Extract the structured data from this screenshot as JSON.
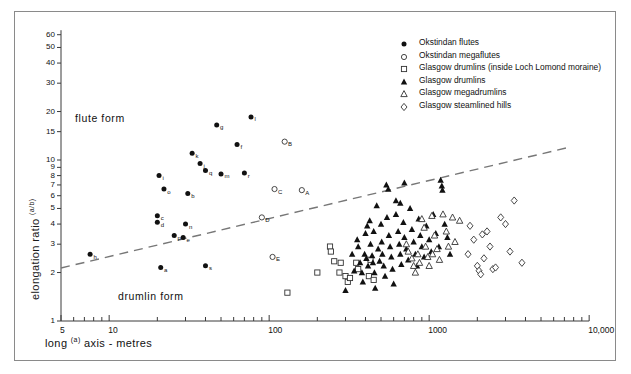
{
  "figure": {
    "region_labels": [
      {
        "text": "flute form",
        "x": 75,
        "y": 112
      },
      {
        "text": "drumlin form",
        "x": 118,
        "y": 290
      }
    ],
    "trend_line": {
      "x1": 61,
      "y1": 268,
      "x2": 566,
      "y2": 148,
      "style": "dashed"
    }
  },
  "legend": {
    "items": [
      {
        "symbol": "filled-circle",
        "label": "Okstindan flutes"
      },
      {
        "symbol": "open-circle",
        "label": "Okstindan megaflutes"
      },
      {
        "symbol": "open-square",
        "label": "Glasgow drumlins (inside Loch Lomond moraine)"
      },
      {
        "symbol": "filled-triangle",
        "label": "Glasgow drumlins"
      },
      {
        "symbol": "open-triangle",
        "label": "Glasgow megadrumlins"
      },
      {
        "symbol": "open-diamond",
        "label": "Glasgow steamlined hills"
      }
    ]
  },
  "chart_data": {
    "type": "scatter",
    "title": "",
    "xlabel": "long (a) axis  -  metres",
    "ylabel": "elongation ratio (a/b)",
    "xscale": "log",
    "yscale": "log",
    "xlim": [
      5,
      10000
    ],
    "ylim": [
      1,
      65
    ],
    "grid": false,
    "legend_position": "top-right",
    "xticks_labeled": [
      {
        "value": 5,
        "label": "5"
      },
      {
        "value": 10,
        "label": "10"
      },
      {
        "value": 100,
        "label": "100"
      },
      {
        "value": 1000,
        "label": "1000"
      },
      {
        "value": 10000,
        "label": "10,000"
      }
    ],
    "xticks_minor": [
      6,
      7,
      8,
      9,
      20,
      30,
      40,
      50,
      60,
      70,
      80,
      90,
      200,
      300,
      400,
      500,
      600,
      700,
      800,
      900,
      2000,
      3000,
      4000,
      5000,
      6000,
      7000,
      8000,
      9000
    ],
    "yticks_labeled": [
      {
        "value": 1,
        "label": "1"
      },
      {
        "value": 2,
        "label": "2"
      },
      {
        "value": 3,
        "label": "3"
      },
      {
        "value": 4,
        "label": "4"
      },
      {
        "value": 5,
        "label": "5"
      },
      {
        "value": 6,
        "label": "6"
      },
      {
        "value": 7,
        "label": "7"
      },
      {
        "value": 8,
        "label": "8"
      },
      {
        "value": 9,
        "label": "9"
      },
      {
        "value": 10,
        "label": "10"
      },
      {
        "value": 15,
        "label": "15"
      },
      {
        "value": 20,
        "label": "20"
      },
      {
        "value": 30,
        "label": "30"
      },
      {
        "value": 40,
        "label": "40"
      },
      {
        "value": 50,
        "label": "50"
      },
      {
        "value": 60,
        "label": "60"
      }
    ],
    "annotation_line": {
      "label": "",
      "from": [
        5,
        2.0
      ],
      "to": [
        10000,
        11.5
      ]
    },
    "series": [
      {
        "name": "Okstindan flutes",
        "symbol": "filled-circle",
        "points": [
          {
            "x": 7.6,
            "y": 2.6,
            "label": "h"
          },
          {
            "x": 20,
            "y": 4.5,
            "label": "c"
          },
          {
            "x": 20,
            "y": 4.1,
            "label": "d"
          },
          {
            "x": 20.5,
            "y": 8.0,
            "label": "i"
          },
          {
            "x": 22,
            "y": 6.6,
            "label": "o"
          },
          {
            "x": 25.5,
            "y": 3.4,
            "label": "p"
          },
          {
            "x": 29,
            "y": 3.3,
            "label": "e"
          },
          {
            "x": 21,
            "y": 2.15,
            "label": "a"
          },
          {
            "x": 31,
            "y": 6.2,
            "label": "b"
          },
          {
            "x": 33,
            "y": 11.0,
            "label": "k"
          },
          {
            "x": 37,
            "y": 9.5,
            "label": "j"
          },
          {
            "x": 40,
            "y": 8.6,
            "label": "q"
          },
          {
            "x": 40,
            "y": 2.2,
            "label": "s"
          },
          {
            "x": 47,
            "y": 16.5,
            "label": "g"
          },
          {
            "x": 50,
            "y": 8.2,
            "label": "m"
          },
          {
            "x": 63,
            "y": 12.5,
            "label": "f"
          },
          {
            "x": 70,
            "y": 8.3,
            "label": "r"
          },
          {
            "x": 77,
            "y": 18.5,
            "label": "l"
          },
          {
            "x": 30,
            "y": 4.0,
            "label": "n"
          }
        ]
      },
      {
        "name": "Okstindan megaflutes",
        "symbol": "open-circle",
        "points": [
          {
            "x": 90,
            "y": 4.4,
            "label": "D"
          },
          {
            "x": 105,
            "y": 2.5,
            "label": "E"
          },
          {
            "x": 108,
            "y": 6.6,
            "label": "C"
          },
          {
            "x": 125,
            "y": 13.0,
            "label": "B"
          },
          {
            "x": 160,
            "y": 6.5,
            "label": "A"
          }
        ]
      },
      {
        "name": "Glasgow drumlins (inside Loch Lomond moraine)",
        "symbol": "open-square",
        "points": [
          {
            "x": 130,
            "y": 1.5
          },
          {
            "x": 200,
            "y": 2.0
          },
          {
            "x": 240,
            "y": 2.9
          },
          {
            "x": 243,
            "y": 2.7
          },
          {
            "x": 255,
            "y": 2.35
          },
          {
            "x": 275,
            "y": 2.0
          },
          {
            "x": 280,
            "y": 2.3
          },
          {
            "x": 300,
            "y": 1.9
          },
          {
            "x": 310,
            "y": 1.75
          },
          {
            "x": 320,
            "y": 1.85
          },
          {
            "x": 350,
            "y": 2.3
          },
          {
            "x": 360,
            "y": 2.1
          },
          {
            "x": 420,
            "y": 1.9
          },
          {
            "x": 430,
            "y": 2.4
          },
          {
            "x": 450,
            "y": 1.8
          }
        ]
      },
      {
        "name": "Glasgow drumlins",
        "symbol": "filled-triangle",
        "points": [
          {
            "x": 300,
            "y": 1.55
          },
          {
            "x": 330,
            "y": 2.6
          },
          {
            "x": 340,
            "y": 2.05
          },
          {
            "x": 355,
            "y": 3.2
          },
          {
            "x": 360,
            "y": 2.9
          },
          {
            "x": 370,
            "y": 2.3
          },
          {
            "x": 380,
            "y": 2.0
          },
          {
            "x": 385,
            "y": 1.75
          },
          {
            "x": 395,
            "y": 2.6
          },
          {
            "x": 400,
            "y": 3.5
          },
          {
            "x": 405,
            "y": 2.45
          },
          {
            "x": 410,
            "y": 3.9
          },
          {
            "x": 415,
            "y": 2.2
          },
          {
            "x": 425,
            "y": 4.2
          },
          {
            "x": 430,
            "y": 3.0
          },
          {
            "x": 440,
            "y": 2.55
          },
          {
            "x": 445,
            "y": 2.3
          },
          {
            "x": 450,
            "y": 3.6
          },
          {
            "x": 455,
            "y": 2.0
          },
          {
            "x": 460,
            "y": 1.6
          },
          {
            "x": 470,
            "y": 5.2
          },
          {
            "x": 480,
            "y": 2.8
          },
          {
            "x": 490,
            "y": 2.35
          },
          {
            "x": 500,
            "y": 4.0
          },
          {
            "x": 505,
            "y": 3.1
          },
          {
            "x": 510,
            "y": 2.6
          },
          {
            "x": 520,
            "y": 2.2
          },
          {
            "x": 530,
            "y": 1.9
          },
          {
            "x": 545,
            "y": 4.4
          },
          {
            "x": 555,
            "y": 6.6
          },
          {
            "x": 560,
            "y": 3.4
          },
          {
            "x": 570,
            "y": 2.9
          },
          {
            "x": 580,
            "y": 2.5
          },
          {
            "x": 590,
            "y": 2.1
          },
          {
            "x": 600,
            "y": 1.7
          },
          {
            "x": 620,
            "y": 4.6
          },
          {
            "x": 640,
            "y": 3.6
          },
          {
            "x": 650,
            "y": 3.0
          },
          {
            "x": 660,
            "y": 2.6
          },
          {
            "x": 670,
            "y": 2.25
          },
          {
            "x": 690,
            "y": 4.1
          },
          {
            "x": 700,
            "y": 3.3
          },
          {
            "x": 720,
            "y": 2.8
          },
          {
            "x": 740,
            "y": 2.4
          },
          {
            "x": 760,
            "y": 5.0
          },
          {
            "x": 780,
            "y": 3.7
          },
          {
            "x": 800,
            "y": 3.1
          },
          {
            "x": 820,
            "y": 2.6
          },
          {
            "x": 840,
            "y": 2.2
          },
          {
            "x": 860,
            "y": 4.3
          },
          {
            "x": 880,
            "y": 3.4
          },
          {
            "x": 900,
            "y": 2.9
          },
          {
            "x": 930,
            "y": 2.5
          },
          {
            "x": 960,
            "y": 3.9
          },
          {
            "x": 1000,
            "y": 3.2
          },
          {
            "x": 1030,
            "y": 2.7
          },
          {
            "x": 1060,
            "y": 4.6
          },
          {
            "x": 1100,
            "y": 3.5
          },
          {
            "x": 1150,
            "y": 2.9
          },
          {
            "x": 1200,
            "y": 6.9
          },
          {
            "x": 1210,
            "y": 6.5
          },
          {
            "x": 1250,
            "y": 4.0
          },
          {
            "x": 1300,
            "y": 3.3
          },
          {
            "x": 1350,
            "y": 2.6
          },
          {
            "x": 540,
            "y": 7.0
          },
          {
            "x": 700,
            "y": 7.2
          },
          {
            "x": 1180,
            "y": 7.5
          },
          {
            "x": 620,
            "y": 5.6
          },
          {
            "x": 660,
            "y": 5.4
          }
        ]
      },
      {
        "name": "Glasgow megadrumlins",
        "symbol": "open-triangle",
        "points": [
          {
            "x": 780,
            "y": 2.45
          },
          {
            "x": 800,
            "y": 2.2
          },
          {
            "x": 820,
            "y": 2.0
          },
          {
            "x": 850,
            "y": 2.6
          },
          {
            "x": 870,
            "y": 2.3
          },
          {
            "x": 900,
            "y": 4.3
          },
          {
            "x": 930,
            "y": 3.8
          },
          {
            "x": 950,
            "y": 2.9
          },
          {
            "x": 980,
            "y": 2.5
          },
          {
            "x": 1000,
            "y": 2.2
          },
          {
            "x": 1040,
            "y": 4.5
          },
          {
            "x": 1080,
            "y": 3.4
          },
          {
            "x": 1120,
            "y": 2.8
          },
          {
            "x": 1160,
            "y": 2.4
          },
          {
            "x": 1220,
            "y": 4.6
          },
          {
            "x": 1280,
            "y": 3.6
          },
          {
            "x": 1320,
            "y": 2.9
          },
          {
            "x": 1400,
            "y": 4.4
          },
          {
            "x": 1450,
            "y": 3.1
          },
          {
            "x": 1550,
            "y": 4.2
          },
          {
            "x": 720,
            "y": 3.0
          },
          {
            "x": 740,
            "y": 2.7
          },
          {
            "x": 1050,
            "y": 2.6
          }
        ]
      },
      {
        "name": "Glasgow steamlined hills",
        "symbol": "open-diamond",
        "points": [
          {
            "x": 1800,
            "y": 3.9
          },
          {
            "x": 1900,
            "y": 3.2
          },
          {
            "x": 2000,
            "y": 2.2
          },
          {
            "x": 2050,
            "y": 2.05
          },
          {
            "x": 2100,
            "y": 1.95
          },
          {
            "x": 2200,
            "y": 2.45
          },
          {
            "x": 2300,
            "y": 3.6
          },
          {
            "x": 2400,
            "y": 2.9
          },
          {
            "x": 2500,
            "y": 2.1
          },
          {
            "x": 2600,
            "y": 2.15
          },
          {
            "x": 2800,
            "y": 4.4
          },
          {
            "x": 3000,
            "y": 4.0
          },
          {
            "x": 3200,
            "y": 2.7
          },
          {
            "x": 3400,
            "y": 5.6
          },
          {
            "x": 3800,
            "y": 2.3
          },
          {
            "x": 1750,
            "y": 2.6
          },
          {
            "x": 2150,
            "y": 3.45
          }
        ]
      }
    ]
  }
}
